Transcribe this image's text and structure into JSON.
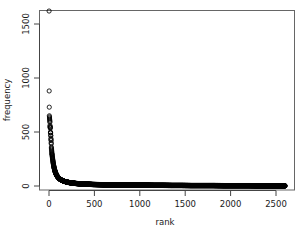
{
  "figure": {
    "background_color": "#ffffff",
    "plot_box_color": "#555555",
    "point_color": "#000000",
    "text_color": "#1a1a1a",
    "point_symbol": "open-circle"
  },
  "chart_data": {
    "type": "scatter",
    "title": "",
    "subtitle": "",
    "xlabel": "rank",
    "ylabel": "frequency",
    "xlim": [
      -30,
      2680
    ],
    "ylim": [
      -40,
      1700
    ],
    "grid": false,
    "legend": null,
    "legend_position": "none",
    "x_ticks": [
      0,
      500,
      1000,
      1500,
      2000,
      2500
    ],
    "x_tick_labels": [
      "0",
      "500",
      "1000",
      "1500",
      "2000",
      "2500"
    ],
    "y_ticks": [
      0,
      500,
      1000,
      1500
    ],
    "y_tick_labels": [
      "0",
      "500",
      "1000",
      "1500"
    ],
    "marker": "open-circle",
    "marker_size": 2.1,
    "n_points": 2600,
    "annotations": [],
    "x": [
      1,
      2,
      3,
      4,
      5,
      6,
      7,
      8,
      9,
      10,
      11,
      12,
      13,
      14,
      15,
      16,
      17,
      18,
      19,
      20,
      21,
      22,
      23,
      24,
      25,
      26,
      27,
      28,
      29,
      30,
      32,
      34,
      36,
      38,
      40,
      43,
      46,
      49,
      52,
      56,
      60,
      65,
      70,
      75,
      80,
      88,
      96,
      104,
      114,
      124,
      136,
      150,
      165,
      180,
      200,
      220,
      245,
      270,
      300,
      330,
      365,
      400,
      440,
      485,
      530,
      580,
      635,
      695,
      760,
      830,
      905,
      985,
      1070,
      1160,
      1255,
      1355,
      1460,
      1570,
      1685,
      1805,
      1930,
      2060,
      2195,
      2330,
      2450,
      2550,
      2600
    ],
    "y": [
      1620,
      880,
      730,
      650,
      640,
      630,
      620,
      610,
      600,
      590,
      560,
      550,
      545,
      540,
      535,
      500,
      495,
      490,
      470,
      465,
      440,
      430,
      420,
      400,
      390,
      360,
      350,
      340,
      330,
      320,
      300,
      290,
      275,
      262,
      250,
      232,
      215,
      200,
      186,
      170,
      156,
      140,
      128,
      116,
      106,
      94,
      84,
      76,
      68,
      61,
      55,
      49,
      44,
      40,
      36,
      32,
      29,
      26,
      23,
      21,
      19,
      17,
      16,
      14,
      13,
      12,
      11,
      10,
      9,
      9,
      8,
      7,
      7,
      6,
      6,
      5,
      5,
      4,
      4,
      4,
      3,
      3,
      3,
      2,
      2,
      2,
      1
    ]
  },
  "axes": {
    "x_axis_name": "rank-axis",
    "y_axis_name": "frequency-axis"
  }
}
